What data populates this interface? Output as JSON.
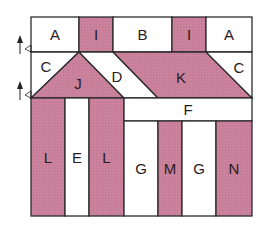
{
  "colors": {
    "pink": "#c9809a",
    "white": "#ffffff",
    "stroke": "#2b2b2b"
  },
  "pieces": [
    {
      "id": "A1",
      "label": "A",
      "fill": "white",
      "shape": "rect",
      "x": 31,
      "y": 17,
      "w": 48,
      "h": 35
    },
    {
      "id": "I1",
      "label": "I",
      "fill": "pink",
      "shape": "rect",
      "x": 79,
      "y": 17,
      "w": 34,
      "h": 35
    },
    {
      "id": "B",
      "label": "B",
      "fill": "white",
      "shape": "rect",
      "x": 113,
      "y": 17,
      "w": 59,
      "h": 35
    },
    {
      "id": "I2",
      "label": "I",
      "fill": "pink",
      "shape": "rect",
      "x": 172,
      "y": 17,
      "w": 34,
      "h": 35
    },
    {
      "id": "A2",
      "label": "A",
      "fill": "white",
      "shape": "rect",
      "x": 206,
      "y": 17,
      "w": 46,
      "h": 35
    },
    {
      "id": "C1",
      "label": "C",
      "fill": "white",
      "shape": "poly",
      "points": "31,52 79,52 31,98",
      "lx": 46,
      "ly": 66
    },
    {
      "id": "J",
      "label": "J",
      "fill": "pink",
      "shape": "poly",
      "points": "79,52 124,98 31,98",
      "lx": 78,
      "ly": 83
    },
    {
      "id": "D",
      "label": "D",
      "fill": "white",
      "shape": "poly",
      "points": "79,52 113,52 158,98 124,98",
      "lx": 117,
      "ly": 76
    },
    {
      "id": "K",
      "label": "K",
      "fill": "pink",
      "shape": "poly",
      "points": "113,52 206,52 252,98 158,98",
      "lx": 181,
      "ly": 77
    },
    {
      "id": "C2",
      "label": "C",
      "fill": "white",
      "shape": "poly",
      "points": "206,52 252,52 252,98",
      "lx": 239,
      "ly": 67
    },
    {
      "id": "L1",
      "label": "L",
      "fill": "pink",
      "shape": "rect",
      "x": 31,
      "y": 98,
      "w": 34,
      "h": 118
    },
    {
      "id": "E",
      "label": "E",
      "fill": "white",
      "shape": "rect",
      "x": 65,
      "y": 98,
      "w": 24,
      "h": 118
    },
    {
      "id": "L2",
      "label": "L",
      "fill": "pink",
      "shape": "rect",
      "x": 89,
      "y": 98,
      "w": 35,
      "h": 118
    },
    {
      "id": "F",
      "label": "F",
      "fill": "white",
      "shape": "rect",
      "x": 124,
      "y": 98,
      "w": 128,
      "h": 23
    },
    {
      "id": "G1",
      "label": "G",
      "fill": "white",
      "shape": "rect",
      "x": 124,
      "y": 121,
      "w": 34,
      "h": 95
    },
    {
      "id": "M",
      "label": "M",
      "fill": "pink",
      "shape": "rect",
      "x": 158,
      "y": 121,
      "w": 24,
      "h": 95
    },
    {
      "id": "G2",
      "label": "G",
      "fill": "white",
      "shape": "rect",
      "x": 182,
      "y": 121,
      "w": 34,
      "h": 95
    },
    {
      "id": "N",
      "label": "N",
      "fill": "pink",
      "shape": "rect",
      "x": 216,
      "y": 121,
      "w": 36,
      "h": 95
    }
  ],
  "markers": [
    {
      "id": "arrow-row1",
      "x": 20,
      "y": 52
    },
    {
      "id": "arrow-row2",
      "x": 20,
      "y": 98
    }
  ]
}
